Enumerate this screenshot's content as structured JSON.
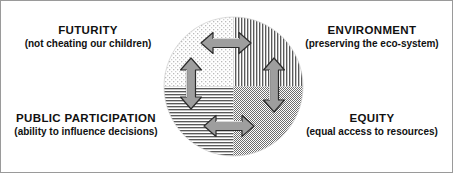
{
  "diagram": {
    "kind": "four-quadrant-circle",
    "center_shape": "circle",
    "colors": {
      "background": "#ffffff",
      "border": "#9a9a9a",
      "text": "#111111",
      "arrow_fill": "#9e9e9e",
      "arrow_stroke": "#2b2b2b",
      "pattern_ink": "#4a4a4a"
    },
    "quadrants": [
      {
        "id": "top-left",
        "pattern": "sparse-dots",
        "label_ref": "futurity"
      },
      {
        "id": "top-right",
        "pattern": "vertical-lines",
        "label_ref": "environment"
      },
      {
        "id": "bottom-left",
        "pattern": "horizontal-lines",
        "label_ref": "public_participation"
      },
      {
        "id": "bottom-right",
        "pattern": "dense-checkerboard",
        "label_ref": "equity"
      }
    ],
    "arrows": [
      {
        "id": "arrow-top-horizontal",
        "orientation": "horizontal",
        "heads": "double",
        "connects": [
          "futurity",
          "environment"
        ]
      },
      {
        "id": "arrow-bottom-horizontal",
        "orientation": "horizontal",
        "heads": "double",
        "connects": [
          "public_participation",
          "equity"
        ]
      },
      {
        "id": "arrow-left-vertical",
        "orientation": "vertical",
        "heads": "double",
        "connects": [
          "futurity",
          "public_participation"
        ]
      },
      {
        "id": "arrow-right-vertical",
        "orientation": "vertical",
        "heads": "double",
        "connects": [
          "environment",
          "equity"
        ]
      }
    ]
  },
  "labels": {
    "futurity": {
      "title": "FUTURITY",
      "subtitle": "(not cheating our children)"
    },
    "environment": {
      "title": "ENVIRONMENT",
      "subtitle": "(preserving the eco-system)"
    },
    "public_participation": {
      "title": "PUBLIC PARTICIPATION",
      "subtitle": "(ability to influence decisions)"
    },
    "equity": {
      "title": "EQUITY",
      "subtitle": "(equal access to resources)"
    }
  }
}
